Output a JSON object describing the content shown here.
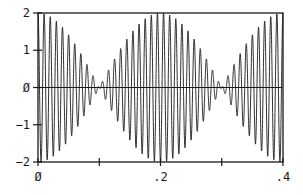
{
  "chart_data": {
    "type": "line",
    "title": "",
    "xlabel": "",
    "ylabel": "",
    "xlim": [
      0,
      0.4
    ],
    "ylim": [
      -2,
      2
    ],
    "grid": false,
    "legend": null,
    "x_ticks": [
      0,
      0.1,
      0.2,
      0.3,
      0.4
    ],
    "x_tick_labels": [
      "Ø",
      "",
      ".2",
      "",
      ".4"
    ],
    "y_ticks": [
      2,
      1,
      0,
      -1,
      -2
    ],
    "y_tick_labels": [
      "2",
      "1",
      "Ø",
      "-1",
      "-2"
    ],
    "zero_line": true,
    "series": [
      {
        "name": "beat signal",
        "description": "Sum of two cosines producing beats: 2*cos(2*pi*2.5*t)*cos(2*pi*100*t)",
        "components": [
          {
            "amplitude": 1,
            "frequency_hz": 97.5
          },
          {
            "amplitude": 1,
            "frequency_hz": 102.5
          }
        ],
        "carrier_frequency_hz": 100,
        "envelope_frequency_hz": 2.5,
        "envelope_max_at": [
          0,
          0.2,
          0.4
        ],
        "envelope_nodes_at": [
          0.1,
          0.3
        ],
        "amplitude_range": [
          -2,
          2
        ],
        "color": "#1a1a1a"
      }
    ]
  }
}
